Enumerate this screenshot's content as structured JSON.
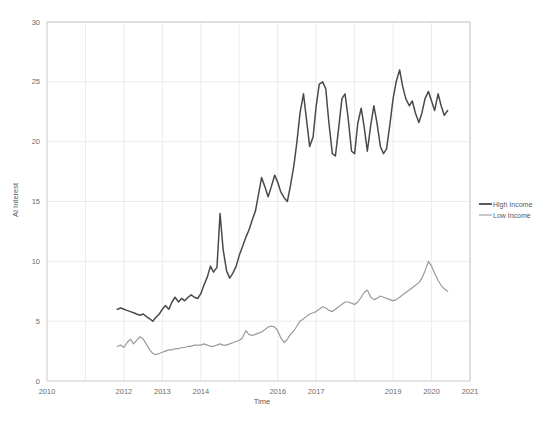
{
  "chart_data": {
    "type": "line",
    "title": "",
    "xlabel": "Time",
    "ylabel": "AI Interest",
    "xlim": [
      2010,
      2021
    ],
    "ylim": [
      0,
      30
    ],
    "grid": true,
    "legend_position": "right",
    "xticks": [
      2010,
      2012,
      2013,
      2014,
      2016,
      2017,
      2019,
      2020,
      2021
    ],
    "xtick_labels": [
      "2010",
      "2012",
      "2013",
      "2014",
      "2016",
      "2017",
      "2019",
      "2020",
      "2021"
    ],
    "yticks": [
      0,
      5,
      10,
      15,
      20,
      25,
      30
    ],
    "ytick_labels": [
      "0",
      "5",
      "10",
      "15",
      "20",
      "25",
      "30"
    ],
    "series": [
      {
        "name": "High Income",
        "color": "#4a4a4a",
        "x": [
          2011.83,
          2011.92,
          2012.0,
          2012.08,
          2012.17,
          2012.25,
          2012.33,
          2012.42,
          2012.5,
          2012.58,
          2012.67,
          2012.75,
          2012.83,
          2012.92,
          2013.0,
          2013.08,
          2013.17,
          2013.25,
          2013.33,
          2013.42,
          2013.5,
          2013.58,
          2013.67,
          2013.75,
          2013.83,
          2013.92,
          2014.0,
          2014.08,
          2014.17,
          2014.25,
          2014.33,
          2014.42,
          2014.5,
          2014.58,
          2014.67,
          2014.75,
          2014.83,
          2014.92,
          2015.0,
          2015.08,
          2015.17,
          2015.25,
          2015.33,
          2015.42,
          2015.5,
          2015.58,
          2015.67,
          2015.75,
          2015.83,
          2015.92,
          2016.0,
          2016.08,
          2016.17,
          2016.25,
          2016.33,
          2016.42,
          2016.5,
          2016.58,
          2016.67,
          2016.75,
          2016.83,
          2016.92,
          2017.0,
          2017.08,
          2017.17,
          2017.25,
          2017.33,
          2017.42,
          2017.5,
          2017.58,
          2017.67,
          2017.75,
          2017.83,
          2017.92,
          2018.0,
          2018.08,
          2018.17,
          2018.25,
          2018.33,
          2018.42,
          2018.5,
          2018.58,
          2018.67,
          2018.75,
          2018.83,
          2018.92,
          2019.0,
          2019.08,
          2019.17,
          2019.25,
          2019.33,
          2019.42,
          2019.5,
          2019.58,
          2019.67,
          2019.75,
          2019.83,
          2019.92,
          2020.0,
          2020.08,
          2020.17,
          2020.25,
          2020.33,
          2020.42
        ],
        "y": [
          6.0,
          6.1,
          6.0,
          5.9,
          5.8,
          5.7,
          5.6,
          5.5,
          5.6,
          5.4,
          5.2,
          5.0,
          5.3,
          5.6,
          6.0,
          6.3,
          6.0,
          6.6,
          7.0,
          6.6,
          6.9,
          6.7,
          7.0,
          7.2,
          7.0,
          6.9,
          7.3,
          8.0,
          8.7,
          9.6,
          9.1,
          9.5,
          14.0,
          11.0,
          9.2,
          8.6,
          9.0,
          9.6,
          10.5,
          11.2,
          12.0,
          12.6,
          13.4,
          14.2,
          15.6,
          17.0,
          16.2,
          15.4,
          16.2,
          17.2,
          16.6,
          15.8,
          15.3,
          15.0,
          16.3,
          18.0,
          20.0,
          22.4,
          24.0,
          21.8,
          19.6,
          20.4,
          23.0,
          24.8,
          25.0,
          24.4,
          21.6,
          19.0,
          18.8,
          21.0,
          23.6,
          24.0,
          22.0,
          19.2,
          19.0,
          21.5,
          22.8,
          21.2,
          19.2,
          21.4,
          23.0,
          21.6,
          19.6,
          19.0,
          19.4,
          21.5,
          23.6,
          25.0,
          26.0,
          24.6,
          23.6,
          23.0,
          23.4,
          22.4,
          21.6,
          22.4,
          23.6,
          24.2,
          23.4,
          22.6,
          24.0,
          23.0,
          22.2,
          22.6
        ]
      },
      {
        "name": "Low Income",
        "color": "#9a9a9a",
        "x": [
          2011.83,
          2011.92,
          2012.0,
          2012.08,
          2012.17,
          2012.25,
          2012.33,
          2012.42,
          2012.5,
          2012.58,
          2012.67,
          2012.75,
          2012.83,
          2012.92,
          2013.0,
          2013.08,
          2013.17,
          2013.25,
          2013.33,
          2013.42,
          2013.5,
          2013.58,
          2013.67,
          2013.75,
          2013.83,
          2013.92,
          2014.0,
          2014.08,
          2014.17,
          2014.25,
          2014.33,
          2014.42,
          2014.5,
          2014.58,
          2014.67,
          2014.75,
          2014.83,
          2014.92,
          2015.0,
          2015.08,
          2015.17,
          2015.25,
          2015.33,
          2015.42,
          2015.5,
          2015.58,
          2015.67,
          2015.75,
          2015.83,
          2015.92,
          2016.0,
          2016.08,
          2016.17,
          2016.25,
          2016.33,
          2016.42,
          2016.5,
          2016.58,
          2016.67,
          2016.75,
          2016.83,
          2016.92,
          2017.0,
          2017.08,
          2017.17,
          2017.25,
          2017.33,
          2017.42,
          2017.5,
          2017.58,
          2017.67,
          2017.75,
          2017.83,
          2017.92,
          2018.0,
          2018.08,
          2018.17,
          2018.25,
          2018.33,
          2018.42,
          2018.5,
          2018.58,
          2018.67,
          2018.75,
          2018.83,
          2018.92,
          2019.0,
          2019.08,
          2019.17,
          2019.25,
          2019.33,
          2019.42,
          2019.5,
          2019.58,
          2019.67,
          2019.75,
          2019.83,
          2019.92,
          2020.0,
          2020.08,
          2020.17,
          2020.25,
          2020.33,
          2020.42
        ],
        "y": [
          2.9,
          3.0,
          2.8,
          3.2,
          3.5,
          3.1,
          3.4,
          3.7,
          3.5,
          3.1,
          2.6,
          2.3,
          2.2,
          2.3,
          2.4,
          2.5,
          2.6,
          2.6,
          2.7,
          2.7,
          2.8,
          2.8,
          2.9,
          2.9,
          3.0,
          3.0,
          3.0,
          3.1,
          3.0,
          2.9,
          2.9,
          3.0,
          3.1,
          3.0,
          3.0,
          3.1,
          3.2,
          3.3,
          3.4,
          3.6,
          4.2,
          3.9,
          3.8,
          3.9,
          4.0,
          4.1,
          4.3,
          4.5,
          4.6,
          4.5,
          4.2,
          3.6,
          3.2,
          3.5,
          3.9,
          4.2,
          4.6,
          5.0,
          5.2,
          5.4,
          5.6,
          5.7,
          5.8,
          6.0,
          6.2,
          6.1,
          5.9,
          5.8,
          6.0,
          6.2,
          6.4,
          6.6,
          6.6,
          6.5,
          6.4,
          6.6,
          7.0,
          7.4,
          7.6,
          7.0,
          6.8,
          6.9,
          7.1,
          7.0,
          6.9,
          6.8,
          6.7,
          6.8,
          7.0,
          7.2,
          7.4,
          7.6,
          7.8,
          8.0,
          8.2,
          8.6,
          9.2,
          10.0,
          9.6,
          9.0,
          8.4,
          8.0,
          7.7,
          7.5
        ]
      }
    ]
  },
  "legend": {
    "items": [
      {
        "label": "High Income",
        "color": "#4a4a4a"
      },
      {
        "label": "Low Income",
        "color": "#9a9a9a"
      }
    ]
  }
}
